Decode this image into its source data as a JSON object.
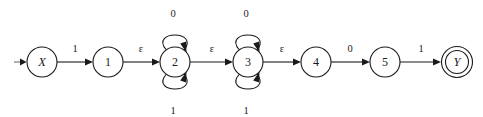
{
  "figure": {
    "kind": "finite-automaton-diagram",
    "background_color": "#ffffff",
    "ink_color": "#1a1a1a"
  },
  "start": {
    "marker_glyph": "start-arrow",
    "target_state": "X"
  },
  "states": [
    {
      "id": "X",
      "label": "X",
      "cx": 42,
      "cy": 62,
      "r": 15,
      "style": "italic",
      "accepting": false,
      "start": true
    },
    {
      "id": "1",
      "label": "1",
      "cx": 108,
      "cy": 62,
      "r": 15,
      "style": "normal",
      "accepting": false,
      "start": false
    },
    {
      "id": "2",
      "label": "2",
      "cx": 175,
      "cy": 62,
      "r": 15,
      "style": "normal",
      "accepting": false,
      "start": false
    },
    {
      "id": "3",
      "label": "3",
      "cx": 248,
      "cy": 62,
      "r": 15,
      "style": "normal",
      "accepting": false,
      "start": false
    },
    {
      "id": "4",
      "label": "4",
      "cx": 316,
      "cy": 62,
      "r": 15,
      "style": "normal",
      "accepting": false,
      "start": false
    },
    {
      "id": "5",
      "label": "5",
      "cx": 385,
      "cy": 62,
      "r": 15,
      "style": "normal",
      "accepting": false,
      "start": false
    },
    {
      "id": "Y",
      "label": "Y",
      "cx": 457,
      "cy": 62,
      "r": 15.5,
      "style": "italic",
      "accepting": true,
      "start": false
    }
  ],
  "transitions": [
    {
      "from": "X",
      "to": "1",
      "label": "1",
      "label_x": 75,
      "label_y": 48
    },
    {
      "from": "1",
      "to": "2",
      "label": "ε",
      "label_x": 141,
      "label_y": 48
    },
    {
      "from": "2",
      "to": "3",
      "label": "ε",
      "label_x": 212,
      "label_y": 48
    },
    {
      "from": "3",
      "to": "4",
      "label": "ε",
      "label_x": 282,
      "label_y": 48
    },
    {
      "from": "4",
      "to": "5",
      "label": "0",
      "label_x": 350,
      "label_y": 48
    },
    {
      "from": "5",
      "to": "Y",
      "label": "1",
      "label_x": 421,
      "label_y": 48
    }
  ],
  "self_loops": [
    {
      "state": "2",
      "label": "0",
      "position": "top",
      "label_x": 173,
      "label_y": 13
    },
    {
      "state": "2",
      "label": "1",
      "position": "bottom",
      "label_x": 173,
      "label_y": 110
    },
    {
      "state": "3",
      "label": "0",
      "position": "top",
      "label_x": 246,
      "label_y": 13
    },
    {
      "state": "3",
      "label": "1",
      "position": "bottom",
      "label_x": 246,
      "label_y": 110
    }
  ],
  "alphabet": [
    "0",
    "1",
    "ε"
  ]
}
